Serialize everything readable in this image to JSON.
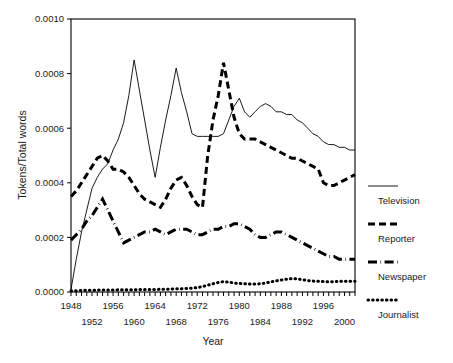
{
  "chart_data": {
    "type": "line",
    "title": "",
    "xlabel": "Year",
    "ylabel": "Tokens/Total words",
    "xlim": [
      1948,
      2002
    ],
    "ylim": [
      0.0,
      0.001
    ],
    "grid": false,
    "legend_position": "right-outside",
    "ytick_labels": [
      "0.0010",
      "0.0008",
      "0.0006",
      "0.0004",
      "0.0002",
      "0.0000"
    ],
    "ytick_values": [
      0.001,
      0.0008,
      0.0006,
      0.0004,
      0.0002,
      0.0
    ],
    "xtick_labels_upper": [
      "1948",
      "1956",
      "1964",
      "1972",
      "1980",
      "1988",
      "1996"
    ],
    "xtick_labels_lower": [
      "1952",
      "1960",
      "1968",
      "1976",
      "1984",
      "1992",
      "2000"
    ],
    "xtick_values_upper": [
      1948,
      1956,
      1964,
      1972,
      1980,
      1988,
      1996
    ],
    "xtick_values_lower": [
      1952,
      1960,
      1968,
      1976,
      1984,
      1992,
      2000
    ],
    "x": [
      1948,
      1949,
      1950,
      1951,
      1952,
      1953,
      1954,
      1955,
      1956,
      1957,
      1958,
      1959,
      1960,
      1961,
      1962,
      1963,
      1964,
      1965,
      1966,
      1967,
      1968,
      1969,
      1970,
      1971,
      1972,
      1973,
      1974,
      1975,
      1976,
      1977,
      1978,
      1979,
      1980,
      1981,
      1982,
      1983,
      1984,
      1985,
      1986,
      1987,
      1988,
      1989,
      1990,
      1991,
      1992,
      1993,
      1994,
      1995,
      1996,
      1997,
      1998,
      1999,
      2000,
      2001,
      2002
    ],
    "series": [
      {
        "name": "Television",
        "style": "solid",
        "width": 0.9,
        "color": "#000000",
        "values": [
          1e-05,
          0.00012,
          0.00022,
          0.0003,
          0.00038,
          0.00042,
          0.00045,
          0.00047,
          0.00052,
          0.00056,
          0.00062,
          0.00072,
          0.00085,
          0.00074,
          0.00063,
          0.00052,
          0.00042,
          0.00053,
          0.00063,
          0.00072,
          0.00082,
          0.00073,
          0.00066,
          0.00058,
          0.00057,
          0.00057,
          0.00057,
          0.00057,
          0.00057,
          0.00058,
          0.00063,
          0.00068,
          0.00071,
          0.00066,
          0.00064,
          0.00066,
          0.00068,
          0.00069,
          0.00068,
          0.00066,
          0.00066,
          0.00065,
          0.00065,
          0.00063,
          0.00062,
          0.0006,
          0.00058,
          0.00057,
          0.00055,
          0.00054,
          0.00054,
          0.00053,
          0.00053,
          0.00052,
          0.00052
        ]
      },
      {
        "name": "Reporter",
        "style": "dashed",
        "width": 3.0,
        "color": "#000000",
        "values": [
          0.00035,
          0.00037,
          0.0004,
          0.00043,
          0.00046,
          0.00049,
          0.0005,
          0.00048,
          0.00045,
          0.00045,
          0.00044,
          0.00042,
          0.00039,
          0.00036,
          0.00034,
          0.00033,
          0.00032,
          0.00031,
          0.00034,
          0.00038,
          0.00041,
          0.00042,
          0.00039,
          0.00035,
          0.00032,
          0.00031,
          0.0005,
          0.00063,
          0.00072,
          0.00084,
          0.00074,
          0.00064,
          0.00058,
          0.00056,
          0.00056,
          0.00056,
          0.00055,
          0.00054,
          0.00053,
          0.00052,
          0.00051,
          0.0005,
          0.00049,
          0.00049,
          0.00048,
          0.00047,
          0.00046,
          0.00045,
          0.0004,
          0.00039,
          0.00039,
          0.0004,
          0.00041,
          0.00042,
          0.00043
        ]
      },
      {
        "name": "Newspaper",
        "style": "dashdot",
        "width": 3.0,
        "color": "#000000",
        "values": [
          0.00019,
          0.00021,
          0.00023,
          0.00026,
          0.00028,
          0.00031,
          0.00034,
          0.0003,
          0.00026,
          0.00022,
          0.00018,
          0.00019,
          0.0002,
          0.00021,
          0.00022,
          0.00022,
          0.00023,
          0.00022,
          0.00021,
          0.00022,
          0.00023,
          0.00023,
          0.00023,
          0.00022,
          0.00021,
          0.00021,
          0.00022,
          0.00023,
          0.00023,
          0.00024,
          0.00024,
          0.00025,
          0.00025,
          0.00024,
          0.00023,
          0.00021,
          0.0002,
          0.0002,
          0.00021,
          0.00022,
          0.00022,
          0.00021,
          0.0002,
          0.00019,
          0.00018,
          0.00017,
          0.00016,
          0.00015,
          0.00014,
          0.00013,
          0.00013,
          0.00012,
          0.00012,
          0.00012,
          0.00012
        ]
      },
      {
        "name": "Journalist",
        "style": "dotted",
        "width": 3.0,
        "color": "#000000",
        "values": [
          5e-06,
          5e-06,
          6e-06,
          6e-06,
          6e-06,
          7e-06,
          7e-06,
          7e-06,
          7e-06,
          8e-06,
          8e-06,
          8e-06,
          8e-06,
          9e-06,
          9e-06,
          9e-06,
          9e-06,
          1e-05,
          1e-05,
          1.1e-05,
          1.2e-05,
          1.2e-05,
          1.3e-05,
          1.4e-05,
          1.6e-05,
          2e-05,
          2.5e-05,
          3e-05,
          3.5e-05,
          3.8e-05,
          3.6e-05,
          3.3e-05,
          3.1e-05,
          3e-05,
          2.9e-05,
          2.9e-05,
          3e-05,
          3.3e-05,
          3.7e-05,
          4.1e-05,
          4.4e-05,
          4.7e-05,
          4.9e-05,
          4.8e-05,
          4.5e-05,
          4.2e-05,
          4e-05,
          3.9e-05,
          3.8e-05,
          3.7e-05,
          3.8e-05,
          3.9e-05,
          3.9e-05,
          3.9e-05,
          3.9e-05
        ]
      }
    ]
  },
  "legend": {
    "items": [
      {
        "label": "Television",
        "style": "solid"
      },
      {
        "label": "Reporter",
        "style": "dashed"
      },
      {
        "label": "Newspaper",
        "style": "dashdot"
      },
      {
        "label": "Journalist",
        "style": "dotted"
      }
    ]
  }
}
